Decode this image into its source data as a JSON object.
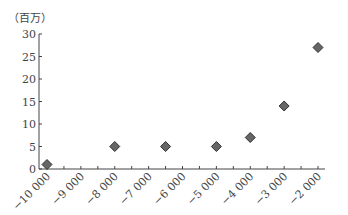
{
  "chart_data": {
    "type": "scatter",
    "title": "",
    "unit_label": "（百万）",
    "xlabel": "",
    "ylabel": "（百万）",
    "xlim": [
      -10000,
      -2000
    ],
    "ylim": [
      0,
      30
    ],
    "grid": false,
    "legend": null,
    "x_ticks": [
      "-10 000",
      "-9 000",
      "-8 000",
      "-7 000",
      "-6 000",
      "-5 000",
      "-4 000",
      "-3 000",
      "-2 000"
    ],
    "y_ticks": [
      "0",
      "5",
      "10",
      "15",
      "20",
      "25",
      "30"
    ],
    "points": [
      {
        "x": -10000,
        "y": 1
      },
      {
        "x": -8000,
        "y": 5
      },
      {
        "x": -6500,
        "y": 5
      },
      {
        "x": -5000,
        "y": 5
      },
      {
        "x": -4000,
        "y": 7
      },
      {
        "x": -3000,
        "y": 14
      },
      {
        "x": -2000,
        "y": 27
      }
    ],
    "marker": {
      "shape": "diamond",
      "color": "#666666",
      "edge": "#333333"
    }
  }
}
